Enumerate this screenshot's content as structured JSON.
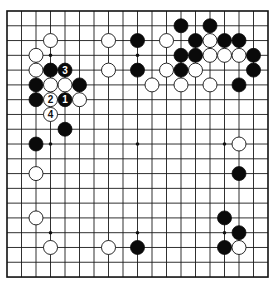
{
  "board": {
    "size": 19,
    "origin_x": 7,
    "origin_y": 11,
    "spacing_x": 14.5,
    "spacing_y": 14.78,
    "stone_radius": 7,
    "colors": {
      "black": "#0a0a0a",
      "white": "#ffffff",
      "line": "#1a1a1a",
      "background": "#ffffff"
    },
    "hoshi": [
      [
        3,
        3
      ],
      [
        9,
        3
      ],
      [
        15,
        3
      ],
      [
        3,
        9
      ],
      [
        9,
        9
      ],
      [
        15,
        9
      ],
      [
        3,
        15
      ],
      [
        9,
        15
      ],
      [
        15,
        15
      ]
    ],
    "stones": [
      {
        "color": "white",
        "col": 3,
        "row": 2
      },
      {
        "color": "white",
        "col": 2,
        "row": 3
      },
      {
        "color": "white",
        "col": 2,
        "row": 4
      },
      {
        "color": "black",
        "col": 3,
        "row": 4
      },
      {
        "color": "black",
        "col": 4,
        "row": 4,
        "label": "3"
      },
      {
        "color": "black",
        "col": 2,
        "row": 5
      },
      {
        "color": "white",
        "col": 3,
        "row": 5
      },
      {
        "color": "white",
        "col": 4,
        "row": 5
      },
      {
        "color": "black",
        "col": 5,
        "row": 5
      },
      {
        "color": "black",
        "col": 2,
        "row": 6
      },
      {
        "color": "white",
        "col": 3,
        "row": 6,
        "label": "2"
      },
      {
        "color": "black",
        "col": 4,
        "row": 6,
        "label": "1"
      },
      {
        "color": "white",
        "col": 5,
        "row": 6
      },
      {
        "color": "white",
        "col": 3,
        "row": 7,
        "label": "4"
      },
      {
        "color": "black",
        "col": 4,
        "row": 8
      },
      {
        "color": "black",
        "col": 2,
        "row": 9
      },
      {
        "color": "white",
        "col": 2,
        "row": 11
      },
      {
        "color": "white",
        "col": 2,
        "row": 14
      },
      {
        "color": "white",
        "col": 3,
        "row": 16
      },
      {
        "color": "white",
        "col": 7,
        "row": 16
      },
      {
        "color": "black",
        "col": 9,
        "row": 16
      },
      {
        "color": "white",
        "col": 7,
        "row": 2
      },
      {
        "color": "black",
        "col": 9,
        "row": 2
      },
      {
        "color": "white",
        "col": 7,
        "row": 4
      },
      {
        "color": "black",
        "col": 9,
        "row": 4
      },
      {
        "color": "white",
        "col": 10,
        "row": 5
      },
      {
        "color": "black",
        "col": 12,
        "row": 1
      },
      {
        "color": "black",
        "col": 14,
        "row": 1
      },
      {
        "color": "white",
        "col": 11,
        "row": 2
      },
      {
        "color": "black",
        "col": 13,
        "row": 2
      },
      {
        "color": "white",
        "col": 14,
        "row": 2
      },
      {
        "color": "black",
        "col": 15,
        "row": 2
      },
      {
        "color": "black",
        "col": 16,
        "row": 2
      },
      {
        "color": "black",
        "col": 12,
        "row": 3
      },
      {
        "color": "black",
        "col": 13,
        "row": 3
      },
      {
        "color": "white",
        "col": 14,
        "row": 3
      },
      {
        "color": "white",
        "col": 15,
        "row": 3
      },
      {
        "color": "white",
        "col": 16,
        "row": 3
      },
      {
        "color": "black",
        "col": 17,
        "row": 3
      },
      {
        "color": "white",
        "col": 11,
        "row": 4
      },
      {
        "color": "black",
        "col": 12,
        "row": 4
      },
      {
        "color": "white",
        "col": 13,
        "row": 4
      },
      {
        "color": "black",
        "col": 17,
        "row": 4
      },
      {
        "color": "white",
        "col": 12,
        "row": 5
      },
      {
        "color": "white",
        "col": 14,
        "row": 5
      },
      {
        "color": "black",
        "col": 16,
        "row": 5
      },
      {
        "color": "white",
        "col": 16,
        "row": 9
      },
      {
        "color": "black",
        "col": 16,
        "row": 11
      },
      {
        "color": "black",
        "col": 15,
        "row": 14
      },
      {
        "color": "black",
        "col": 16,
        "row": 15
      },
      {
        "color": "black",
        "col": 15,
        "row": 16
      },
      {
        "color": "white",
        "col": 16,
        "row": 16
      }
    ]
  }
}
